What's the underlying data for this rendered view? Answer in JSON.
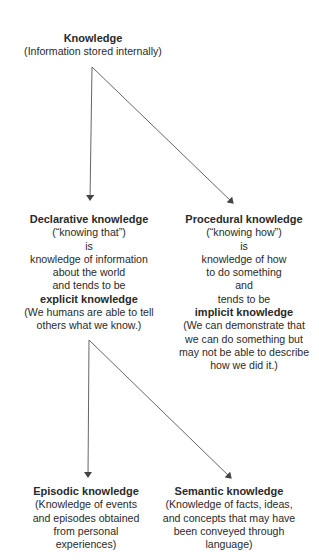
{
  "diagram": {
    "type": "hierarchy",
    "root": {
      "title": "Knowledge",
      "lines": [
        "(Information stored internally)"
      ]
    },
    "declarative": {
      "title": "Declarative knowledge",
      "lines": [
        "(“knowing that”)",
        "is",
        "knowledge of information",
        "about the world",
        "and tends to be"
      ],
      "emphasis": "explicit knowledge",
      "note_lines": [
        "(We humans are able to tell",
        "others what we know.)"
      ]
    },
    "procedural": {
      "title": "Procedural knowledge",
      "lines": [
        "(“knowing how”)",
        "is",
        "knowledge of how",
        "to do something",
        "and",
        "tends to be"
      ],
      "emphasis": "implicit knowledge",
      "note_lines": [
        "(We can demonstrate that",
        "we can do something but",
        "may not be able to describe",
        "how we did it.)"
      ]
    },
    "episodic": {
      "title": "Episodic knowledge",
      "lines": [
        "(Knowledge of events",
        "and episodes obtained",
        "from personal",
        "experiences)"
      ]
    },
    "semantic": {
      "title": "Semantic knowledge",
      "lines": [
        "(Knowledge of facts, ideas,",
        "and concepts that may have",
        "been conveyed through",
        "language)"
      ]
    },
    "edges": [
      {
        "from": "Knowledge",
        "to": "Declarative knowledge"
      },
      {
        "from": "Knowledge",
        "to": "Procedural knowledge"
      },
      {
        "from": "Declarative knowledge",
        "to": "Episodic knowledge"
      },
      {
        "from": "Declarative knowledge",
        "to": "Semantic knowledge"
      }
    ],
    "colors": {
      "text": "#2a2a2a",
      "line": "#555555",
      "background": "#ffffff"
    }
  }
}
